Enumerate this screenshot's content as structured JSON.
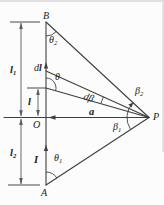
{
  "labels": {
    "point_b": "B",
    "point_a": "A",
    "origin": "O",
    "point_p": "P",
    "current": "I",
    "vector_a": "a",
    "length_l": "l",
    "l1": {
      "base": "l",
      "sub": "1"
    },
    "l2": {
      "base": "l",
      "sub": "2"
    },
    "dl": {
      "d": "d",
      "l": "l"
    },
    "theta": "θ",
    "theta1": {
      "base": "θ",
      "sub": "1"
    },
    "theta2": {
      "base": "θ",
      "sub": "2"
    },
    "beta1": {
      "base": "β",
      "sub": "1"
    },
    "beta2": {
      "base": "β",
      "sub": "2"
    },
    "dbeta": {
      "d": "d",
      "beta": "β"
    }
  },
  "colors": {
    "line": "#3f3f3f",
    "dimension": "#5a5a5a",
    "text": "#1a1a1a",
    "background": "#fcfcfc",
    "artifact": "#d9d9d9"
  }
}
